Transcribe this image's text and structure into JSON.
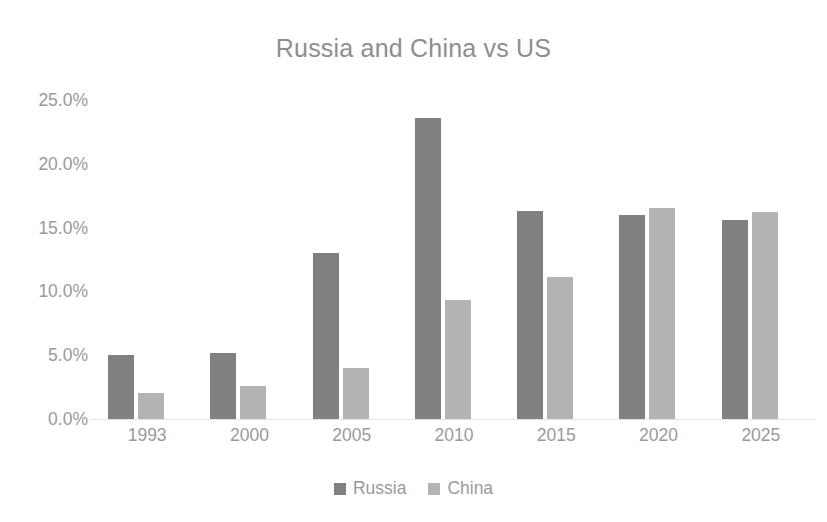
{
  "chart_data": {
    "type": "bar",
    "title": "Russia and China vs US",
    "xlabel": "",
    "ylabel": "",
    "categories": [
      "1993",
      "2000",
      "2005",
      "2010",
      "2015",
      "2020",
      "2025"
    ],
    "series": [
      {
        "name": "Russia",
        "color": "#808080",
        "values": [
          5.0,
          5.2,
          13.0,
          23.6,
          16.3,
          16.0,
          15.6
        ]
      },
      {
        "name": "China",
        "color": "#b3b3b3",
        "values": [
          2.0,
          2.6,
          4.0,
          9.3,
          11.1,
          16.5,
          16.2
        ]
      }
    ],
    "ylim": [
      0,
      25
    ],
    "ytick_values": [
      0,
      5,
      10,
      15,
      20,
      25
    ],
    "ytick_labels": [
      "0.0%",
      "5.0%",
      "10.0%",
      "15.0%",
      "20.0%",
      "25.0%"
    ],
    "grid": false,
    "legend_position": "bottom",
    "unit": "%",
    "background_color": "#ffffff",
    "text_color": "#9a9a9a",
    "title_color": "#8e8e8e"
  }
}
